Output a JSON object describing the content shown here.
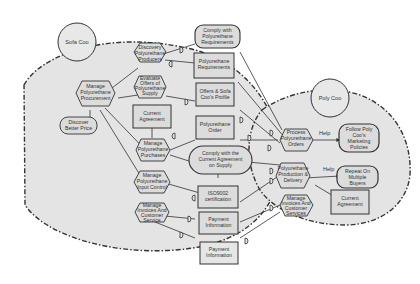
{
  "diagram": {
    "type": "i* strategic rationale model",
    "colors": {
      "boundary_fill": "#e4e4e4",
      "node_fill": "#dcdcdc",
      "stroke": "#333333",
      "background": "#ffffff"
    },
    "actors": [
      {
        "id": "sofa",
        "label": "Sofa Coo"
      },
      {
        "id": "poly",
        "label": "Poly Coo"
      }
    ],
    "sofa_elements": [
      {
        "id": "discovery",
        "kind": "task",
        "lines": [
          "Discovery",
          "Polyurethane",
          "Producers"
        ]
      },
      {
        "id": "manage_proc",
        "kind": "task",
        "lines": [
          "Manage",
          "Polyurethane",
          "Procurement"
        ]
      },
      {
        "id": "evaluate",
        "kind": "task",
        "lines": [
          "Evaluate",
          "Offers of",
          "Polyurethane",
          "Supply"
        ]
      },
      {
        "id": "better_price",
        "kind": "softgoal",
        "lines": [
          "Discover",
          "Better Price"
        ]
      },
      {
        "id": "current_agreement_left",
        "kind": "resource",
        "lines": [
          "Current",
          "Agreement"
        ]
      },
      {
        "id": "manage_purchases",
        "kind": "task",
        "lines": [
          "Manage",
          "Polyurethane",
          "Purchases"
        ]
      },
      {
        "id": "manage_input",
        "kind": "task",
        "lines": [
          "Manage",
          "Polyurethane",
          "Input Control"
        ]
      },
      {
        "id": "manage_invoices_left",
        "kind": "task",
        "lines": [
          "Manage",
          "Invoices And",
          "Customer",
          "Service"
        ]
      }
    ],
    "dependums": [
      {
        "id": "comply_req",
        "kind": "softgoal",
        "lines": [
          "Comply with",
          "Polyurethane",
          "Requirements"
        ]
      },
      {
        "id": "poly_req",
        "kind": "resource",
        "lines": [
          "Polyurethane",
          "Requirements"
        ]
      },
      {
        "id": "offers_profile",
        "kind": "resource",
        "lines": [
          "Offers & Sofa",
          "Coo's Profile"
        ]
      },
      {
        "id": "poly_order",
        "kind": "resource",
        "lines": [
          "Polyurethane",
          "Order"
        ]
      },
      {
        "id": "comply_agreement",
        "kind": "goal",
        "lines": [
          "Comply with the",
          "Current Agreement",
          "on Supply"
        ]
      },
      {
        "id": "iso",
        "kind": "resource",
        "lines": [
          "ISO9002",
          "certification"
        ]
      },
      {
        "id": "payment1",
        "kind": "resource",
        "lines": [
          "Payment",
          "Information"
        ]
      },
      {
        "id": "payment2",
        "kind": "resource",
        "lines": [
          "Payment",
          "Information"
        ]
      }
    ],
    "poly_elements": [
      {
        "id": "process_orders",
        "kind": "task",
        "lines": [
          "Process",
          "Polyurethane",
          "Orders"
        ]
      },
      {
        "id": "follow_policies",
        "kind": "softgoal",
        "lines": [
          "Follow Poly",
          "Coo's",
          "Marketing",
          "Policies"
        ]
      },
      {
        "id": "production",
        "kind": "task",
        "lines": [
          "Polyurethane",
          "Production &",
          "Delivery"
        ]
      },
      {
        "id": "repeat_buyers",
        "kind": "softgoal",
        "lines": [
          "Repeat On",
          "Multiple",
          "Buyers"
        ]
      },
      {
        "id": "current_agreement_right",
        "kind": "resource",
        "lines": [
          "Current",
          "Agreement"
        ]
      },
      {
        "id": "manage_invoices_right",
        "kind": "task",
        "lines": [
          "Manage",
          "Invoices And",
          "Customer",
          "Services"
        ]
      }
    ],
    "contributions": [
      {
        "from": "process_orders",
        "to": "follow_policies",
        "label": "Help"
      },
      {
        "from": "production",
        "to": "repeat_buyers",
        "label": "Help"
      }
    ]
  }
}
